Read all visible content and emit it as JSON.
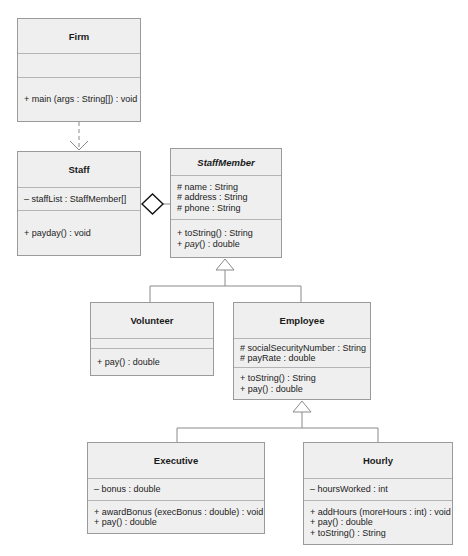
{
  "diagram": {
    "type": "UML class diagram",
    "classes": {
      "firm": {
        "name": "Firm",
        "attributes": [],
        "methods": [
          "+ main (args : String[]) : void"
        ]
      },
      "staff": {
        "name": "Staff",
        "attributes": [
          "– staffList : StaffMember[]"
        ],
        "methods": [
          "+ payday() : void"
        ]
      },
      "staff_member": {
        "name": "StaffMember",
        "abstract": true,
        "attributes": [
          "# name : String",
          "# address : String",
          "# phone : String"
        ],
        "methods": [
          "+ toString() : String",
          "+ pay() : double"
        ]
      },
      "volunteer": {
        "name": "Volunteer",
        "attributes": [],
        "methods": [
          "+ pay() : double"
        ]
      },
      "employee": {
        "name": "Employee",
        "attributes": [
          "# socialSecurityNumber : String",
          "# payRate : double"
        ],
        "methods": [
          "+ toString() : String",
          "+ pay() : double"
        ]
      },
      "executive": {
        "name": "Executive",
        "attributes": [
          "– bonus : double"
        ],
        "methods": [
          "+ awardBonus (execBonus : double) : void",
          "+ pay() : double"
        ]
      },
      "hourly": {
        "name": "Hourly",
        "attributes": [
          "– hoursWorked : int"
        ],
        "methods": [
          "+ addHours (moreHours : int) : void",
          "+ pay() : double",
          "+ toString() : String"
        ]
      }
    },
    "relationships": [
      {
        "type": "dependency",
        "from": "Firm",
        "to": "Staff"
      },
      {
        "type": "aggregation",
        "whole": "Staff",
        "part": "StaffMember"
      },
      {
        "type": "generalization",
        "child": "Volunteer",
        "parent": "StaffMember"
      },
      {
        "type": "generalization",
        "child": "Employee",
        "parent": "StaffMember"
      },
      {
        "type": "generalization",
        "child": "Executive",
        "parent": "Employee"
      },
      {
        "type": "generalization",
        "child": "Hourly",
        "parent": "Employee"
      }
    ],
    "colors": {
      "box_fill": "#efefef",
      "box_border": "#9a9a9a",
      "line": "#8a8a8a",
      "text": "#222222"
    }
  }
}
